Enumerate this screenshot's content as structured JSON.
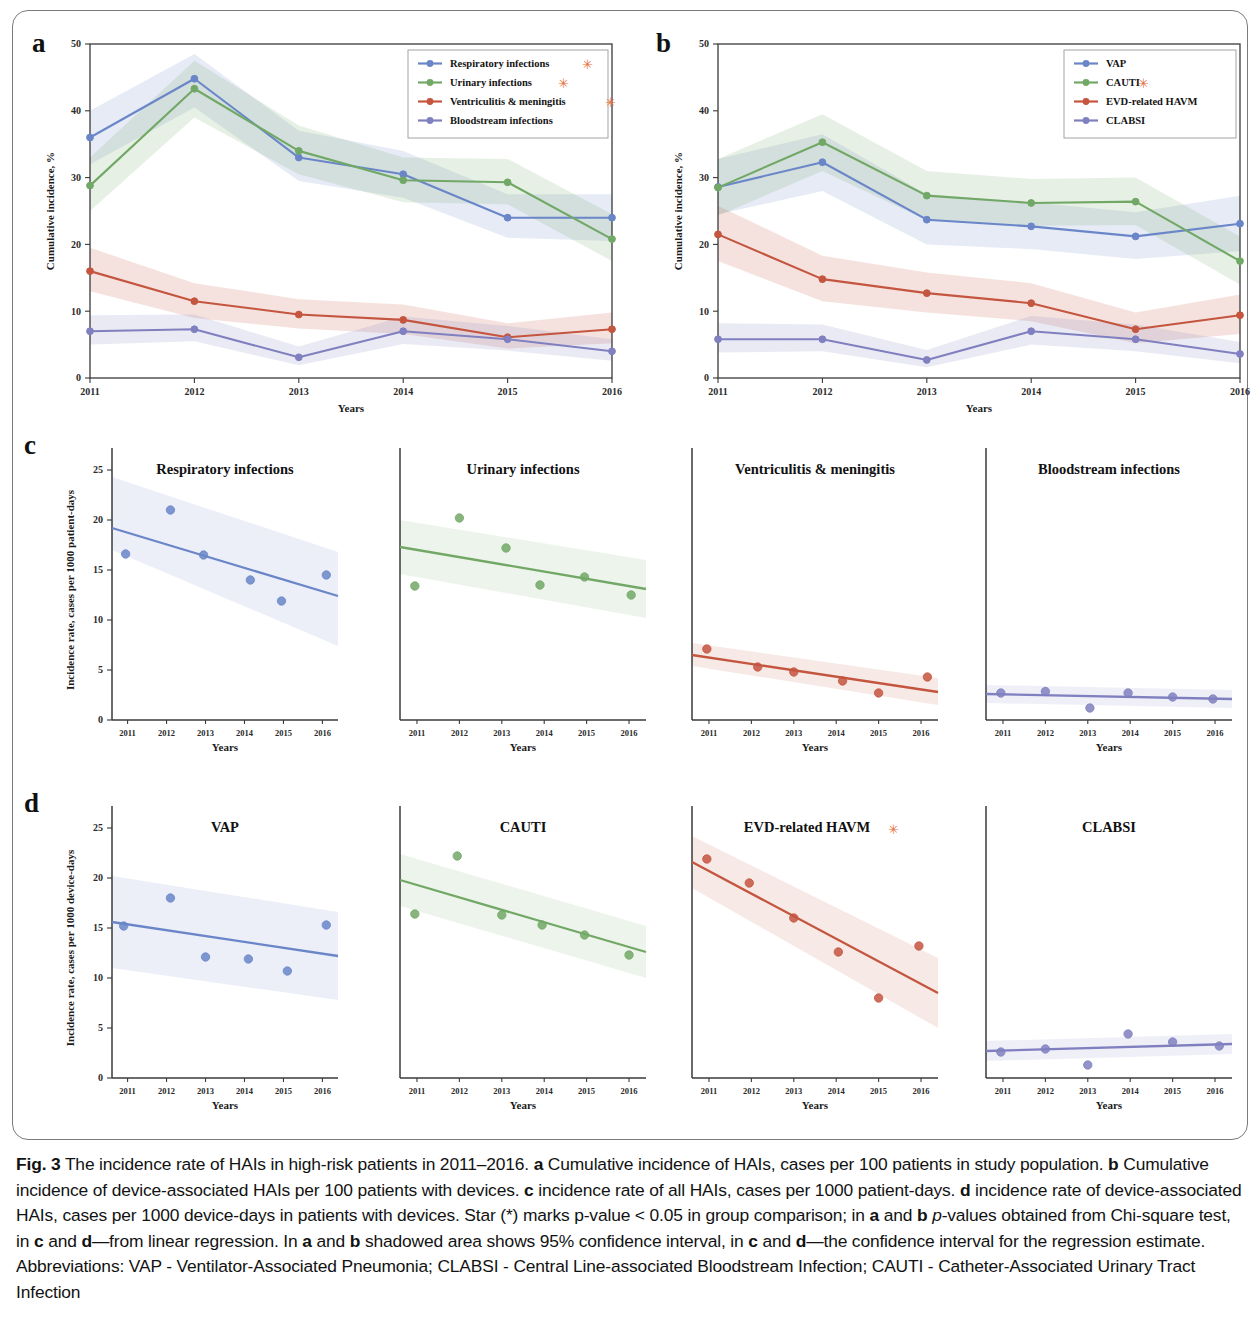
{
  "figure": {
    "label": "Fig. 3",
    "caption_parts": [
      {
        "t": "Fig. 3",
        "b": true
      },
      {
        "t": " The incidence rate of HAIs in high-risk patients in 2011–2016. "
      },
      {
        "t": "a",
        "b": true
      },
      {
        "t": " Cumulative incidence of HAIs, cases per 100 patients in study population. "
      },
      {
        "t": "b",
        "b": true
      },
      {
        "t": " Cumulative incidence of device-associated HAIs per 100 patients with devices. "
      },
      {
        "t": "c",
        "b": true
      },
      {
        "t": " incidence rate of all HAIs, cases per 1000 patient-days. "
      },
      {
        "t": "d",
        "b": true
      },
      {
        "t": " incidence rate of device-associated HAIs, cases per 1000 device-days in patients with devices. Star (*) marks p-value < 0.05 in group comparison; in "
      },
      {
        "t": "a",
        "b": true
      },
      {
        "t": " and "
      },
      {
        "t": "b",
        "b": true
      },
      {
        "t": " "
      },
      {
        "t": "p",
        "i": true
      },
      {
        "t": "-values obtained from Chi-square test, in "
      },
      {
        "t": "c",
        "b": true
      },
      {
        "t": " and "
      },
      {
        "t": "d",
        "b": true
      },
      {
        "t": "—from linear regression. In "
      },
      {
        "t": "a",
        "b": true
      },
      {
        "t": " and "
      },
      {
        "t": "b",
        "b": true
      },
      {
        "t": " shadowed area shows 95% confidence interval, in "
      },
      {
        "t": "c",
        "b": true
      },
      {
        "t": " and "
      },
      {
        "t": "d",
        "b": true
      },
      {
        "t": "—the confidence interval for the regression estimate. Abbreviations: VAP - Ventilator-Associated Pneumonia; CLABSI - Central Line-associated Bloodstream Infection; CAUTI - Catheter-Associated Urinary Tract Infection"
      }
    ],
    "panel_letters": {
      "a": "a",
      "b": "b",
      "c": "c",
      "d": "d"
    }
  },
  "colors": {
    "blue": "#6a86c8",
    "green": "#72a866",
    "red": "#c4553f",
    "purple": "#8080c0",
    "star": "#e8703a",
    "axis": "#3a3a3a"
  },
  "chart_data": [
    {
      "id": "panel_a",
      "type": "line",
      "title": "",
      "xlabel": "Years",
      "ylabel": "Cumulative incidence, %",
      "x": [
        "2011",
        "2012",
        "2013",
        "2014",
        "2015",
        "2016"
      ],
      "xlim": [
        2011,
        2016
      ],
      "ylim": [
        0,
        50
      ],
      "yticks": [
        0,
        10,
        20,
        30,
        40,
        50
      ],
      "grid": false,
      "legend_position": "top-right",
      "band": "95% confidence interval",
      "series": [
        {
          "name": "Respiratory infections",
          "star": true,
          "color": "#6a86c8",
          "values": [
            36.0,
            44.8,
            33.0,
            30.5,
            24.0,
            24.0
          ],
          "lower": [
            32.0,
            40.5,
            29.5,
            27.0,
            21.0,
            20.5
          ],
          "upper": [
            40.0,
            48.5,
            37.0,
            34.0,
            27.5,
            27.5
          ]
        },
        {
          "name": "Urinary infections",
          "star": true,
          "color": "#72a866",
          "values": [
            28.8,
            43.3,
            34.0,
            29.6,
            29.3,
            20.8
          ],
          "lower": [
            25.0,
            39.0,
            30.5,
            26.3,
            26.0,
            17.5
          ],
          "upper": [
            33.0,
            47.5,
            37.8,
            33.0,
            32.8,
            24.5
          ]
        },
        {
          "name": "Ventriculitis & meningitis",
          "star": true,
          "color": "#c4553f",
          "values": [
            16.0,
            11.5,
            9.5,
            8.7,
            6.1,
            7.3
          ],
          "lower": [
            13.0,
            9.0,
            7.4,
            6.6,
            4.4,
            5.2
          ],
          "upper": [
            19.5,
            14.2,
            11.8,
            11.0,
            8.2,
            9.8
          ]
        },
        {
          "name": "Bloodstream infections",
          "star": false,
          "color": "#8080c0",
          "values": [
            7.0,
            7.3,
            3.1,
            7.0,
            5.8,
            4.0
          ],
          "lower": [
            5.0,
            5.5,
            1.9,
            5.1,
            4.1,
            2.6
          ],
          "upper": [
            9.4,
            9.5,
            4.7,
            9.2,
            7.8,
            5.8
          ]
        }
      ]
    },
    {
      "id": "panel_b",
      "type": "line",
      "title": "",
      "xlabel": "Years",
      "ylabel": "Cumulative incidence, %",
      "x": [
        "2011",
        "2012",
        "2013",
        "2014",
        "2015",
        "2016"
      ],
      "xlim": [
        2011,
        2016
      ],
      "ylim": [
        0,
        50
      ],
      "yticks": [
        0,
        10,
        20,
        30,
        40,
        50
      ],
      "grid": false,
      "legend_position": "top-right",
      "band": "95% confidence interval",
      "series": [
        {
          "name": "VAP",
          "star": false,
          "color": "#6a86c8",
          "values": [
            28.6,
            32.3,
            23.7,
            22.7,
            21.2,
            23.1
          ],
          "lower": [
            24.5,
            28.0,
            20.0,
            19.3,
            17.8,
            19.0
          ],
          "upper": [
            32.8,
            36.5,
            27.5,
            26.3,
            24.8,
            27.3
          ]
        },
        {
          "name": "CAUTI",
          "star": true,
          "color": "#72a866",
          "values": [
            28.5,
            35.3,
            27.3,
            26.2,
            26.4,
            17.5
          ],
          "lower": [
            24.3,
            31.0,
            23.6,
            22.8,
            22.9,
            14.0
          ],
          "upper": [
            32.8,
            39.5,
            31.0,
            29.8,
            30.0,
            21.2
          ]
        },
        {
          "name": "EVD-related HAVM",
          "star": false,
          "color": "#c4553f",
          "values": [
            21.5,
            14.8,
            12.7,
            11.2,
            7.3,
            9.4
          ],
          "lower": [
            17.5,
            11.5,
            9.8,
            8.5,
            5.2,
            6.6
          ],
          "upper": [
            25.8,
            18.3,
            15.8,
            14.2,
            9.8,
            12.5
          ]
        },
        {
          "name": "CLABSI",
          "star": false,
          "color": "#8080c0",
          "values": [
            5.8,
            5.8,
            2.7,
            7.0,
            5.8,
            3.6
          ],
          "lower": [
            3.8,
            4.0,
            1.6,
            5.0,
            4.0,
            2.2
          ],
          "upper": [
            8.2,
            8.0,
            4.2,
            9.3,
            8.0,
            5.4
          ]
        }
      ]
    },
    {
      "id": "panel_c1",
      "type": "scatter",
      "title": "Respiratory infections",
      "star": false,
      "xlabel": "Years",
      "ylabel": "Incidence rate, cases per 1000 patient-days",
      "color": "#6a86c8",
      "xlim": [
        2010.6,
        2016.4
      ],
      "ylim": [
        0,
        26
      ],
      "yticks": [
        0,
        5,
        10,
        15,
        20,
        25
      ],
      "xticks": [
        "2011",
        "2012",
        "2013",
        "2014",
        "2015",
        "2016"
      ],
      "points": [
        {
          "x": 2010.95,
          "y": 16.6
        },
        {
          "x": 2012.1,
          "y": 21.0
        },
        {
          "x": 2012.95,
          "y": 16.5
        },
        {
          "x": 2014.15,
          "y": 14.0
        },
        {
          "x": 2014.95,
          "y": 11.9
        },
        {
          "x": 2016.1,
          "y": 14.5
        }
      ],
      "fit": {
        "x0": 2010.6,
        "y0": 19.2,
        "x1": 2016.4,
        "y1": 12.4
      },
      "ci": {
        "lower0": 17.0,
        "upper0": 24.3,
        "lower1": 7.4,
        "upper1": 16.8
      }
    },
    {
      "id": "panel_c2",
      "type": "scatter",
      "title": "Urinary infections",
      "star": false,
      "xlabel": "Years",
      "ylabel": "",
      "color": "#72a866",
      "xlim": [
        2010.6,
        2016.4
      ],
      "ylim": [
        0,
        26
      ],
      "yticks": [
        0,
        5,
        10,
        15,
        20,
        25
      ],
      "xticks": [
        "2011",
        "2012",
        "2013",
        "2014",
        "2015",
        "2016"
      ],
      "points": [
        {
          "x": 2010.95,
          "y": 13.4
        },
        {
          "x": 2012.0,
          "y": 20.2
        },
        {
          "x": 2013.1,
          "y": 17.2
        },
        {
          "x": 2013.9,
          "y": 13.5
        },
        {
          "x": 2014.95,
          "y": 14.3
        },
        {
          "x": 2016.05,
          "y": 12.5
        }
      ],
      "fit": {
        "x0": 2010.6,
        "y0": 17.3,
        "x1": 2016.4,
        "y1": 13.1
      },
      "ci": {
        "lower0": 14.6,
        "upper0": 20.0,
        "lower1": 10.2,
        "upper1": 16.0
      }
    },
    {
      "id": "panel_c3",
      "type": "scatter",
      "title": "Ventriculitis & meningitis",
      "star": false,
      "xlabel": "Years",
      "ylabel": "",
      "color": "#c4553f",
      "xlim": [
        2010.6,
        2016.4
      ],
      "ylim": [
        0,
        26
      ],
      "yticks": [
        0,
        5,
        10,
        15,
        20,
        25
      ],
      "xticks": [
        "2011",
        "2012",
        "2013",
        "2014",
        "2015",
        "2016"
      ],
      "points": [
        {
          "x": 2010.95,
          "y": 7.1
        },
        {
          "x": 2012.15,
          "y": 5.3
        },
        {
          "x": 2013.0,
          "y": 4.8
        },
        {
          "x": 2014.15,
          "y": 3.9
        },
        {
          "x": 2015.0,
          "y": 2.7
        },
        {
          "x": 2016.15,
          "y": 4.3
        }
      ],
      "fit": {
        "x0": 2010.6,
        "y0": 6.5,
        "x1": 2016.4,
        "y1": 2.8
      },
      "ci": {
        "lower0": 5.4,
        "upper0": 7.7,
        "lower1": 1.5,
        "upper1": 4.2
      }
    },
    {
      "id": "panel_c4",
      "type": "scatter",
      "title": "Bloodstream infections",
      "star": false,
      "xlabel": "Years",
      "ylabel": "",
      "color": "#8080c0",
      "xlim": [
        2010.6,
        2016.4
      ],
      "ylim": [
        0,
        26
      ],
      "yticks": [
        0,
        5,
        10,
        15,
        20,
        25
      ],
      "xticks": [
        "2011",
        "2012",
        "2013",
        "2014",
        "2015",
        "2016"
      ],
      "points": [
        {
          "x": 2010.95,
          "y": 2.7
        },
        {
          "x": 2012.0,
          "y": 2.85
        },
        {
          "x": 2013.05,
          "y": 1.2
        },
        {
          "x": 2013.95,
          "y": 2.7
        },
        {
          "x": 2015.0,
          "y": 2.3
        },
        {
          "x": 2015.95,
          "y": 2.1
        }
      ],
      "fit": {
        "x0": 2010.6,
        "y0": 2.6,
        "x1": 2016.4,
        "y1": 2.1
      },
      "ci": {
        "lower0": 1.7,
        "upper0": 3.5,
        "lower1": 1.2,
        "upper1": 3.0
      }
    },
    {
      "id": "panel_d1",
      "type": "scatter",
      "title": "VAP",
      "star": false,
      "xlabel": "Years",
      "ylabel": "Incidence rate, cases per 1000 device-days",
      "color": "#6a86c8",
      "xlim": [
        2010.6,
        2016.4
      ],
      "ylim": [
        0,
        26
      ],
      "yticks": [
        0,
        5,
        10,
        15,
        20,
        25
      ],
      "xticks": [
        "2011",
        "2012",
        "2013",
        "2014",
        "2015",
        "2016"
      ],
      "points": [
        {
          "x": 2010.9,
          "y": 15.2
        },
        {
          "x": 2012.1,
          "y": 18.0
        },
        {
          "x": 2013.0,
          "y": 12.1
        },
        {
          "x": 2014.1,
          "y": 11.9
        },
        {
          "x": 2015.1,
          "y": 10.7
        },
        {
          "x": 2016.1,
          "y": 15.3
        }
      ],
      "fit": {
        "x0": 2010.6,
        "y0": 15.6,
        "x1": 2016.4,
        "y1": 12.2
      },
      "ci": {
        "lower0": 11.0,
        "upper0": 20.2,
        "lower1": 7.8,
        "upper1": 16.6
      }
    },
    {
      "id": "panel_d2",
      "type": "scatter",
      "title": "CAUTI",
      "star": false,
      "xlabel": "Years",
      "ylabel": "",
      "color": "#72a866",
      "xlim": [
        2010.6,
        2016.4
      ],
      "ylim": [
        0,
        26
      ],
      "yticks": [
        0,
        5,
        10,
        15,
        20,
        25
      ],
      "xticks": [
        "2011",
        "2012",
        "2013",
        "2014",
        "2015",
        "2016"
      ],
      "points": [
        {
          "x": 2010.95,
          "y": 16.4
        },
        {
          "x": 2011.95,
          "y": 22.2
        },
        {
          "x": 2013.0,
          "y": 16.3
        },
        {
          "x": 2013.95,
          "y": 15.3
        },
        {
          "x": 2014.95,
          "y": 14.3
        },
        {
          "x": 2016.0,
          "y": 12.3
        }
      ],
      "fit": {
        "x0": 2010.6,
        "y0": 19.8,
        "x1": 2016.4,
        "y1": 12.6
      },
      "ci": {
        "lower0": 17.2,
        "upper0": 22.4,
        "lower1": 10.0,
        "upper1": 15.2
      }
    },
    {
      "id": "panel_d3",
      "type": "scatter",
      "title": "EVD-related HAVM",
      "star": true,
      "xlabel": "Years",
      "ylabel": "",
      "color": "#c4553f",
      "xlim": [
        2010.6,
        2016.4
      ],
      "ylim": [
        0,
        26
      ],
      "yticks": [
        0,
        5,
        10,
        15,
        20,
        25
      ],
      "xticks": [
        "2011",
        "2012",
        "2013",
        "2014",
        "2015",
        "2016"
      ],
      "points": [
        {
          "x": 2010.95,
          "y": 21.9
        },
        {
          "x": 2011.95,
          "y": 19.5
        },
        {
          "x": 2013.0,
          "y": 16.0
        },
        {
          "x": 2014.05,
          "y": 12.6
        },
        {
          "x": 2015.0,
          "y": 8.0
        },
        {
          "x": 2015.95,
          "y": 13.2
        }
      ],
      "fit": {
        "x0": 2010.6,
        "y0": 21.6,
        "x1": 2016.4,
        "y1": 8.5
      },
      "ci": {
        "lower0": 19.0,
        "upper0": 24.2,
        "lower1": 5.0,
        "upper1": 12.0
      }
    },
    {
      "id": "panel_d4",
      "type": "scatter",
      "title": "CLABSI",
      "star": false,
      "xlabel": "Years",
      "ylabel": "",
      "color": "#8080c0",
      "xlim": [
        2010.6,
        2016.4
      ],
      "ylim": [
        0,
        26
      ],
      "yticks": [
        0,
        5,
        10,
        15,
        20,
        25
      ],
      "xticks": [
        "2011",
        "2012",
        "2013",
        "2014",
        "2015",
        "2016"
      ],
      "points": [
        {
          "x": 2010.95,
          "y": 2.6
        },
        {
          "x": 2012.0,
          "y": 2.9
        },
        {
          "x": 2013.0,
          "y": 1.3
        },
        {
          "x": 2013.95,
          "y": 4.4
        },
        {
          "x": 2015.0,
          "y": 3.6
        },
        {
          "x": 2016.1,
          "y": 3.2
        }
      ],
      "fit": {
        "x0": 2010.6,
        "y0": 2.7,
        "x1": 2016.4,
        "y1": 3.4
      },
      "ci": {
        "lower0": 1.7,
        "upper0": 3.7,
        "lower1": 2.4,
        "upper1": 4.4
      }
    }
  ]
}
